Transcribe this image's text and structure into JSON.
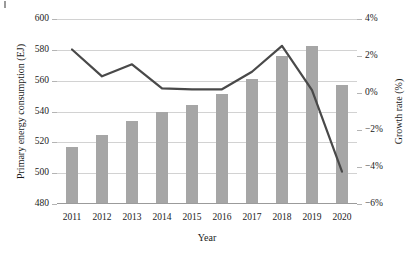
{
  "chart_data": {
    "type": "bar",
    "title": "",
    "categories": [
      "2011",
      "2012",
      "2013",
      "2014",
      "2015",
      "2016",
      "2017",
      "2018",
      "2019",
      "2020"
    ],
    "xlabel": "Year",
    "ylabel": "Primary energy consumption (EJ)",
    "ylabel_secondary": "Growth rate (%)",
    "ylim": [
      480,
      600
    ],
    "yticks": [
      480,
      500,
      520,
      540,
      560,
      580,
      600
    ],
    "ytick_labels": [
      "480",
      "500",
      "520",
      "540",
      "560",
      "580",
      "600"
    ],
    "ylim_secondary": [
      -6,
      4
    ],
    "yticks_secondary": [
      -6,
      -4,
      -2,
      0,
      2,
      4
    ],
    "ytick_labels_secondary": [
      "−6%",
      "−4%",
      "−2%",
      "0%",
      "2%",
      "4%"
    ],
    "grid": true,
    "legend": "none",
    "series": [
      {
        "name": "Primary energy consumption (EJ)",
        "type": "bar",
        "axis": "left",
        "color": "#a6a6a6",
        "values": [
          517,
          524.5,
          534,
          539.5,
          544.5,
          551.5,
          561,
          576,
          582.5,
          557
        ]
      },
      {
        "name": "Growth rate (%)",
        "type": "line",
        "axis": "right",
        "color": "#494949",
        "values": [
          2.35,
          0.9,
          1.55,
          0.25,
          0.2,
          0.2,
          1.15,
          2.55,
          0.15,
          -4.25
        ]
      }
    ]
  }
}
